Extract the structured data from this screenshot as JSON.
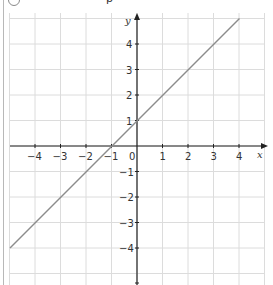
{
  "header": {
    "part_label": "",
    "cut_text": "p"
  },
  "chart_data": {
    "type": "line",
    "title": "",
    "xlabel": "x",
    "ylabel": "y",
    "xlim": [
      -5,
      5
    ],
    "ylim": [
      -5.3,
      5.2
    ],
    "grid": true,
    "x_ticks": [
      -4,
      -3,
      -2,
      -1,
      0,
      1,
      2,
      3,
      4
    ],
    "y_ticks": [
      -4,
      -3,
      -2,
      -1,
      1,
      2,
      3,
      4
    ],
    "origin_label": "0",
    "series": [
      {
        "name": "y = x + 1",
        "x": [
          -5,
          4
        ],
        "y": [
          -4,
          5
        ],
        "color": "#8c8c8c"
      }
    ]
  },
  "labels": {
    "x_ticks": [
      "−4",
      "−3",
      "−2",
      "−1",
      "1",
      "2",
      "3",
      "4"
    ],
    "y_ticks_pos": [
      "1",
      "2",
      "3",
      "4"
    ],
    "y_ticks_neg": [
      "−1",
      "−2",
      "−3",
      "−4"
    ],
    "origin": "0",
    "x_axis": "x",
    "y_axis": "y"
  }
}
